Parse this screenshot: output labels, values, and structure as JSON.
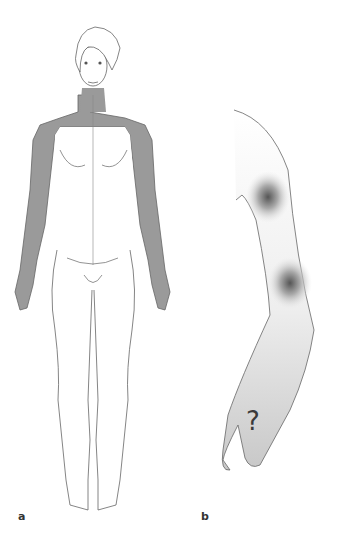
{
  "figure": {
    "panels": [
      {
        "id": "a",
        "label": "a",
        "description": "Front view of female body with shaded shoulders, upper chest and both arms",
        "shade_color": "#9a9a9a"
      },
      {
        "id": "b",
        "label": "b",
        "description": "Arm with two diffuse pain spots at shoulder and elbow, question mark on hand",
        "hand_symbol": "?",
        "spot_color": "#555555",
        "arm_fill": "#d4d4d4"
      }
    ],
    "line_color": "#666666"
  }
}
